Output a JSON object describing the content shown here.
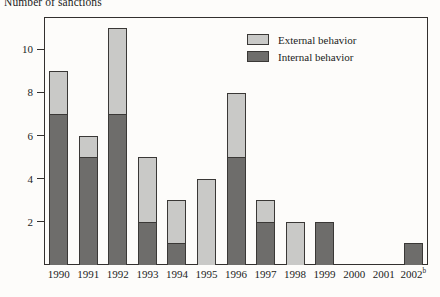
{
  "chart_data": {
    "type": "bar",
    "title": "Number of sanctions",
    "xlabel": "",
    "ylabel": "",
    "ylim": [
      0,
      11.5
    ],
    "yticks": [
      2,
      4,
      6,
      8,
      10
    ],
    "ytick_labels": [
      "2",
      "4",
      "6",
      "8",
      "10"
    ],
    "grid": false,
    "stacked": true,
    "legend_position": "top-right",
    "categories": [
      "1990",
      "1991",
      "1992",
      "1993",
      "1994",
      "1995",
      "1996",
      "1997",
      "1998",
      "1999",
      "2000",
      "2001",
      "2002"
    ],
    "category_labels": [
      {
        "text": "1990",
        "sup": ""
      },
      {
        "text": "1991",
        "sup": ""
      },
      {
        "text": "1992",
        "sup": ""
      },
      {
        "text": "1993",
        "sup": ""
      },
      {
        "text": "1994",
        "sup": ""
      },
      {
        "text": "1995",
        "sup": ""
      },
      {
        "text": "1996",
        "sup": ""
      },
      {
        "text": "1997",
        "sup": ""
      },
      {
        "text": "1998",
        "sup": ""
      },
      {
        "text": "1999",
        "sup": ""
      },
      {
        "text": "2000",
        "sup": ""
      },
      {
        "text": "2001",
        "sup": ""
      },
      {
        "text": "2002",
        "sup": "b"
      }
    ],
    "series": [
      {
        "name": "Internal behavior",
        "color": "#6e6d6b",
        "values": [
          7,
          5,
          7,
          2,
          1,
          0,
          5,
          2,
          0,
          2,
          0,
          0,
          1
        ]
      },
      {
        "name": "External behavior",
        "color": "#c9c9c7",
        "values": [
          2,
          1,
          4,
          3,
          2,
          4,
          3,
          1,
          2,
          0,
          0,
          0,
          0
        ]
      }
    ],
    "totals": [
      9,
      6,
      11,
      5,
      3,
      4,
      8,
      3,
      2,
      2,
      0,
      0,
      1
    ]
  },
  "legend": {
    "entries": [
      {
        "label": "External behavior",
        "swatch": "external"
      },
      {
        "label": "Internal behavior",
        "swatch": "internal"
      }
    ]
  }
}
